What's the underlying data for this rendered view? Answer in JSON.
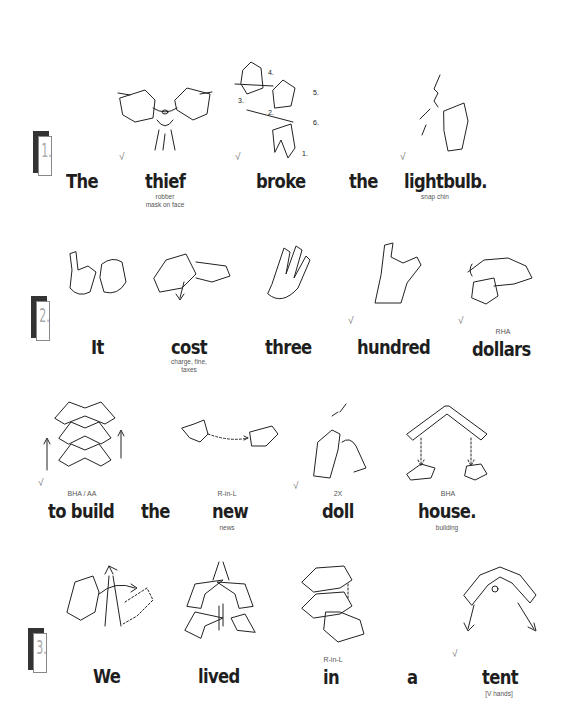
{
  "sentences": [
    {
      "number": "1.",
      "words": [
        {
          "text": "The",
          "check": false
        },
        {
          "text": "thief",
          "check": true,
          "note": "robber\nmask on face",
          "note_lines": [
            "robber",
            "mask on face"
          ]
        },
        {
          "text": "broke",
          "check": true,
          "step_labels": [
            "1.",
            "2.",
            "3.",
            "4.",
            "5.",
            "6."
          ]
        },
        {
          "text": "the",
          "check": false
        },
        {
          "text": "lightbulb.",
          "check": true,
          "note_lines": [
            "snap chin"
          ]
        }
      ]
    },
    {
      "number": "2.",
      "words": [
        {
          "text": "It",
          "check": false
        },
        {
          "text": "cost",
          "check": false,
          "note_lines": [
            "charge, fine,",
            "taxes"
          ]
        },
        {
          "text": "three",
          "check": false
        },
        {
          "text": "hundred",
          "check": true
        },
        {
          "text": "dollars",
          "check": true,
          "above": "RHA"
        },
        {
          "text": "to build",
          "check": true,
          "above": "BHA / AA"
        },
        {
          "text": "the",
          "check": false
        },
        {
          "text": "new",
          "check": false,
          "above": "R-in-L",
          "note_lines": [
            "news"
          ]
        },
        {
          "text": "doll",
          "check": true,
          "above": "2X"
        },
        {
          "text": "house.",
          "check": false,
          "above": "BHA",
          "note_lines": [
            "building"
          ]
        }
      ]
    },
    {
      "number": "3.",
      "words": [
        {
          "text": "We",
          "check": false
        },
        {
          "text": "lived",
          "check": false
        },
        {
          "text": "in",
          "check": false,
          "above": "R-in-L"
        },
        {
          "text": "a",
          "check": false
        },
        {
          "text": "tent",
          "check": true,
          "note_lines": [
            "[V hands]"
          ]
        }
      ]
    }
  ],
  "check_glyph": "√"
}
